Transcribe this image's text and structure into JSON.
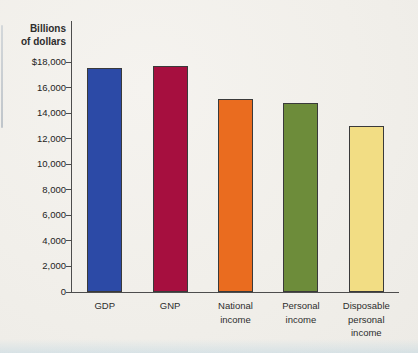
{
  "figure": {
    "y_axis_title": [
      "Billions",
      "of dollars"
    ]
  },
  "chart_data": {
    "type": "bar",
    "title": "",
    "categories": [
      "GDP",
      "GNP",
      "National income",
      "Personal income",
      "Disposable personal income"
    ],
    "values": [
      17500,
      17700,
      15100,
      14800,
      13000
    ],
    "bar_colors": [
      "#2c4aa6",
      "#a60f3f",
      "#ea6c1f",
      "#6d8c3a",
      "#f2dd84"
    ],
    "bar_outline_color": "#3a3a3a",
    "xlabel": "",
    "ylabel": "Billions of dollars",
    "ylim": [
      0,
      18000
    ],
    "ytick_interval": 2000,
    "ytick_labels": [
      "$18,000",
      "16,000",
      "14,000",
      "12,000",
      "10,000",
      "8,000",
      "6,000",
      "4,000",
      "2,000",
      "0"
    ],
    "grid": false,
    "legend": "none",
    "axis_color": "#4d4d4d",
    "text_color": "#2d2d2d",
    "background_color": "#f1efea"
  }
}
